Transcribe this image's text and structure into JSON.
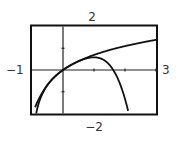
{
  "chart_data": {
    "type": "line",
    "title": "",
    "xlabel": "",
    "ylabel": "",
    "xlim": [
      -1,
      3
    ],
    "ylim": [
      -2,
      2
    ],
    "grid": false,
    "window_labels": {
      "xmin": "−1",
      "xmax": "3",
      "ymin": "−2",
      "ymax": "2"
    },
    "x_ticks": [
      1,
      2,
      3
    ],
    "y_ticks": [
      -1,
      1
    ],
    "series": [
      {
        "name": "f(x) = ln(1+x)",
        "x": [
          -0.87,
          -0.75,
          -0.5,
          -0.25,
          0,
          0.5,
          1,
          1.5,
          2,
          2.5,
          3
        ],
        "values": [
          -2.04,
          -1.39,
          -0.69,
          -0.29,
          0,
          0.41,
          0.69,
          0.92,
          1.1,
          1.25,
          1.39
        ]
      },
      {
        "name": "P4(x) = x - x^2/2 + x^3/3 - x^4/4",
        "x": [
          -0.9,
          -0.75,
          -0.5,
          -0.25,
          0,
          0.5,
          1,
          1.25,
          1.5,
          1.75,
          2,
          2.1
        ],
        "values": [
          -1.71,
          -1.34,
          -0.68,
          -0.29,
          0,
          0.4,
          0.58,
          0.54,
          0.23,
          -0.37,
          -1.33,
          -1.93
        ]
      }
    ]
  },
  "labels": {
    "top": "2",
    "bottom": "−2",
    "left": "−1",
    "right": "3"
  }
}
